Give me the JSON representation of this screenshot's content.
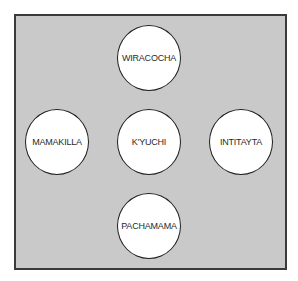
{
  "diagram": {
    "type": "cosmological layout",
    "nodes": [
      {
        "id": "top",
        "label": "WIRACOCHA",
        "position": "top"
      },
      {
        "id": "left",
        "label": "MAMAKILLA",
        "position": "left"
      },
      {
        "id": "center",
        "label": "K'YUCHI",
        "position": "center"
      },
      {
        "id": "right",
        "label": "INTITAYTA",
        "position": "right"
      },
      {
        "id": "bottom",
        "label": "PACHAMAMA",
        "position": "bottom"
      }
    ],
    "colors": {
      "background": "#c9c9c9",
      "border": "#3a3a3a",
      "node_fill": "#ffffff",
      "node_stroke": "#1e1e1e",
      "text": "#2a2a2a"
    }
  }
}
